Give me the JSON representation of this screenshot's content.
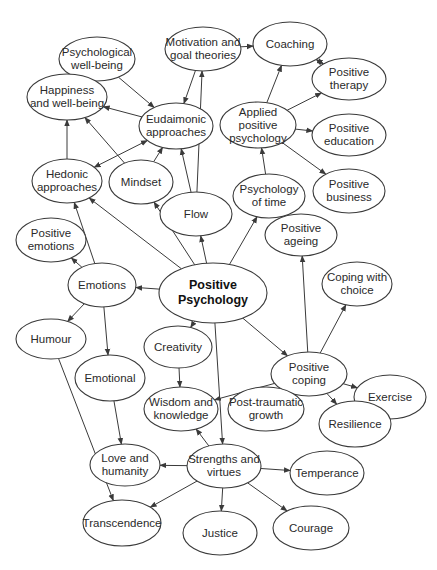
{
  "diagram": {
    "type": "concept-map",
    "colors": {
      "stroke": "#3a3a3a",
      "fill": "#ffffff",
      "text": "#2a2a2a"
    },
    "nodes": [
      {
        "id": "psych_wellbeing",
        "label": "Psychological\nwell-being",
        "cx": 97,
        "cy": 59,
        "rx": 38,
        "ry": 22
      },
      {
        "id": "motivation",
        "label": "Motivation and\ngoal theories",
        "cx": 203,
        "cy": 49,
        "rx": 38,
        "ry": 22
      },
      {
        "id": "coaching",
        "label": "Coaching",
        "cx": 290,
        "cy": 44,
        "rx": 37,
        "ry": 22
      },
      {
        "id": "positive_therapy",
        "label": "Positive\ntherapy",
        "cx": 349,
        "cy": 79,
        "rx": 37,
        "ry": 21
      },
      {
        "id": "happiness",
        "label": "Happiness\nand well-being",
        "cx": 67,
        "cy": 97,
        "rx": 40,
        "ry": 23
      },
      {
        "id": "eudaimonic",
        "label": "Eudaimonic\napproaches",
        "cx": 176,
        "cy": 126,
        "rx": 37,
        "ry": 23
      },
      {
        "id": "applied",
        "label": "Applied positive\npsychology",
        "cx": 258,
        "cy": 125,
        "rx": 38,
        "ry": 23
      },
      {
        "id": "positive_education",
        "label": "Positive\neducation",
        "cx": 349,
        "cy": 135,
        "rx": 37,
        "ry": 21
      },
      {
        "id": "hedonic",
        "label": "Hedonic\napproaches",
        "cx": 67,
        "cy": 181,
        "rx": 35,
        "ry": 22
      },
      {
        "id": "mindset",
        "label": "Mindset",
        "cx": 141,
        "cy": 182,
        "rx": 32,
        "ry": 22
      },
      {
        "id": "flow",
        "label": "Flow",
        "cx": 196,
        "cy": 214,
        "rx": 36,
        "ry": 22
      },
      {
        "id": "psych_time",
        "label": "Psychology\nof time",
        "cx": 269,
        "cy": 196,
        "rx": 36,
        "ry": 22
      },
      {
        "id": "positive_business",
        "label": "Positive\nbusiness",
        "cx": 349,
        "cy": 191,
        "rx": 36,
        "ry": 22
      },
      {
        "id": "positive_emotions",
        "label": "Positive\nemotions",
        "cx": 51,
        "cy": 240,
        "rx": 35,
        "ry": 22
      },
      {
        "id": "positive_ageing",
        "label": "Positive\nageing",
        "cx": 301,
        "cy": 235,
        "rx": 36,
        "ry": 21
      },
      {
        "id": "emotions",
        "label": "Emotions",
        "cx": 102,
        "cy": 285,
        "rx": 34,
        "ry": 22
      },
      {
        "id": "positive_psychology",
        "label": "Positive\nPsychology",
        "cx": 213,
        "cy": 293,
        "rx": 54,
        "ry": 30,
        "bold": true
      },
      {
        "id": "coping_choice",
        "label": "Coping with\nchoice",
        "cx": 357,
        "cy": 284,
        "rx": 35,
        "ry": 22
      },
      {
        "id": "humour",
        "label": "Humour",
        "cx": 51,
        "cy": 339,
        "rx": 35,
        "ry": 20
      },
      {
        "id": "creativity",
        "label": "Creativity",
        "cx": 178,
        "cy": 347,
        "rx": 34,
        "ry": 21
      },
      {
        "id": "positive_coping",
        "label": "Positive\ncoping",
        "cx": 309,
        "cy": 374,
        "rx": 38,
        "ry": 22
      },
      {
        "id": "exercise",
        "label": "Exercise",
        "cx": 390,
        "cy": 397,
        "rx": 36,
        "ry": 22
      },
      {
        "id": "emotional",
        "label": "Emotional",
        "cx": 110,
        "cy": 378,
        "rx": 35,
        "ry": 23
      },
      {
        "id": "wisdom",
        "label": "Wisdom and\nknowledge",
        "cx": 181,
        "cy": 409,
        "rx": 37,
        "ry": 22
      },
      {
        "id": "post_traumatic",
        "label": "Post-traumatic\ngrowth",
        "cx": 266,
        "cy": 409,
        "rx": 38,
        "ry": 22
      },
      {
        "id": "resilience",
        "label": "Resilience",
        "cx": 355,
        "cy": 424,
        "rx": 36,
        "ry": 23
      },
      {
        "id": "love",
        "label": "Love and\nhumanity",
        "cx": 125,
        "cy": 465,
        "rx": 35,
        "ry": 21
      },
      {
        "id": "strengths",
        "label": "Strengths and\nvirtues",
        "cx": 224,
        "cy": 466,
        "rx": 37,
        "ry": 22
      },
      {
        "id": "temperance",
        "label": "Temperance",
        "cx": 327,
        "cy": 473,
        "rx": 37,
        "ry": 22
      },
      {
        "id": "transcendence",
        "label": "Transcendence",
        "cx": 122,
        "cy": 523,
        "rx": 39,
        "ry": 23
      },
      {
        "id": "justice",
        "label": "Justice",
        "cx": 220,
        "cy": 533,
        "rx": 37,
        "ry": 22
      },
      {
        "id": "courage",
        "label": "Courage",
        "cx": 311,
        "cy": 528,
        "rx": 38,
        "ry": 22
      }
    ],
    "edges": [
      {
        "from": "psych_wellbeing",
        "to": "eudaimonic"
      },
      {
        "from": "motivation",
        "to": "eudaimonic"
      },
      {
        "from": "motivation",
        "to": "coaching"
      },
      {
        "from": "coaching",
        "to": "positive_therapy",
        "bidirectional": true
      },
      {
        "from": "eudaimonic",
        "to": "happiness"
      },
      {
        "from": "hedonic",
        "to": "eudaimonic",
        "bidirectional": true
      },
      {
        "from": "hedonic",
        "to": "happiness"
      },
      {
        "from": "mindset",
        "to": "happiness"
      },
      {
        "from": "mindset",
        "to": "eudaimonic"
      },
      {
        "from": "flow",
        "to": "eudaimonic"
      },
      {
        "from": "flow",
        "to": "motivation"
      },
      {
        "from": "applied",
        "to": "coaching"
      },
      {
        "from": "applied",
        "to": "positive_therapy"
      },
      {
        "from": "applied",
        "to": "positive_education"
      },
      {
        "from": "applied",
        "to": "positive_business"
      },
      {
        "from": "psych_time",
        "to": "applied"
      },
      {
        "from": "positive_psychology",
        "to": "flow"
      },
      {
        "from": "positive_psychology",
        "to": "psych_time"
      },
      {
        "from": "positive_psychology",
        "to": "mindset"
      },
      {
        "from": "positive_psychology",
        "to": "hedonic"
      },
      {
        "from": "positive_psychology",
        "to": "emotions"
      },
      {
        "from": "positive_psychology",
        "to": "creativity"
      },
      {
        "from": "positive_psychology",
        "to": "positive_coping"
      },
      {
        "from": "positive_psychology",
        "to": "strengths"
      },
      {
        "from": "emotions",
        "to": "positive_emotions"
      },
      {
        "from": "emotions",
        "to": "hedonic"
      },
      {
        "from": "emotions",
        "to": "humour"
      },
      {
        "from": "emotions",
        "to": "emotional"
      },
      {
        "from": "positive_coping",
        "to": "positive_ageing"
      },
      {
        "from": "positive_coping",
        "to": "coping_choice"
      },
      {
        "from": "positive_coping",
        "to": "exercise"
      },
      {
        "from": "positive_coping",
        "to": "resilience"
      },
      {
        "from": "positive_coping",
        "to": "post_traumatic"
      },
      {
        "from": "positive_coping",
        "to": "wisdom"
      },
      {
        "from": "creativity",
        "to": "wisdom"
      },
      {
        "from": "emotional",
        "to": "love"
      },
      {
        "from": "humour",
        "to": "transcendence"
      },
      {
        "from": "strengths",
        "to": "wisdom"
      },
      {
        "from": "strengths",
        "to": "love"
      },
      {
        "from": "strengths",
        "to": "temperance"
      },
      {
        "from": "strengths",
        "to": "transcendence"
      },
      {
        "from": "strengths",
        "to": "justice"
      },
      {
        "from": "strengths",
        "to": "courage"
      }
    ]
  }
}
